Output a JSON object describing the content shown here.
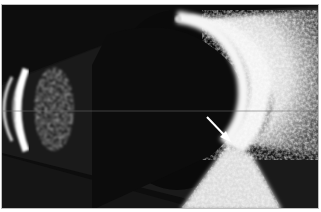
{
  "image": {
    "kind": "ocular B-scan ultrasound",
    "description": "Grayscale B-scan of the eye showing probe arcs at left, a fan-shaped sector, bright echogenic retina/choroid arc on the right, and a white arrow pointing to a focal lesion.",
    "annotation": {
      "type": "arrow",
      "color": "#ffffff"
    },
    "colors": {
      "background": "#0d0d0d",
      "tissue": "#e6e6e6",
      "sector": "#1b1b1b"
    }
  }
}
